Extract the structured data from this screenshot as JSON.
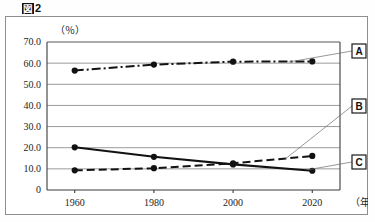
{
  "caption": {
    "box_glyph": "図",
    "number": "2"
  },
  "chart_data": {
    "type": "line",
    "xlabel": "（年）",
    "ylabel": "（％）",
    "x": [
      1960,
      1980,
      2000,
      2020
    ],
    "categories": [
      "1960",
      "1980",
      "2000",
      "2020"
    ],
    "xtick_labels": [
      "1960",
      "1980",
      "2000",
      "2020"
    ],
    "ytick_labels": [
      "0",
      "10.0",
      "20.0",
      "30.0",
      "40.0",
      "50.0",
      "60.0",
      "70.0"
    ],
    "ytick_values": [
      0,
      10,
      20,
      30,
      40,
      50,
      60,
      70
    ],
    "ylim": [
      0,
      70
    ],
    "xlim": [
      1953,
      2027
    ],
    "grid": true,
    "legend_position": "right-callout",
    "series": [
      {
        "name": "A",
        "label": "A",
        "style": "dash-dot",
        "color": "#121212",
        "values": [
          56.5,
          59.3,
          60.7,
          60.8
        ]
      },
      {
        "name": "B",
        "label": "B",
        "style": "dashed",
        "color": "#121212",
        "values": [
          9.3,
          10.3,
          12.6,
          16.1
        ]
      },
      {
        "name": "C",
        "label": "C",
        "style": "solid",
        "color": "#121212",
        "values": [
          20.2,
          15.7,
          12.1,
          9.1
        ]
      }
    ],
    "annotations": [
      {
        "label": "A",
        "series": "A",
        "box_x": 352,
        "box_y": 44
      },
      {
        "label": "B",
        "series": "B",
        "box_x": 352,
        "box_y": 99
      },
      {
        "label": "C",
        "series": "C",
        "box_x": 352,
        "box_y": 155
      }
    ]
  }
}
